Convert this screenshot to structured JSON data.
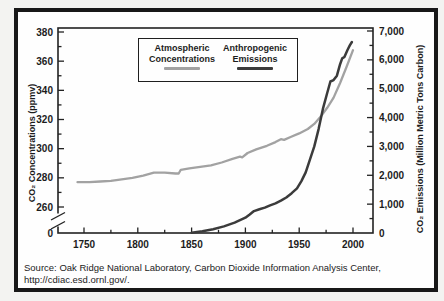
{
  "colors": {
    "concentrations_line": "#a2a2a2",
    "emissions_line": "#3b3b3b",
    "axis": "#222222",
    "frame_border": "#181818"
  },
  "legend": {
    "series1_line1": "Atmospheric",
    "series1_line2": "Concentrations",
    "series2_line1": "Anthropogenic",
    "series2_line2": "Emissions"
  },
  "source": {
    "line1": "Source: Oak Ridge National Laboratory, Carbon Dioxide Information Analysis Center,",
    "line2": "http://cdiac.esd.ornl.gov/."
  },
  "chart_data": {
    "type": "line",
    "title": "",
    "x_axis": {
      "label": "",
      "range": [
        1726,
        2018
      ],
      "ticks": [
        {
          "value": 1750,
          "label": "1750"
        },
        {
          "value": 1800,
          "label": "1800"
        },
        {
          "value": 1850,
          "label": "1850"
        },
        {
          "value": 1900,
          "label": "1900"
        },
        {
          "value": 1950,
          "label": "1950"
        },
        {
          "value": 2000,
          "label": "2000"
        }
      ],
      "minor_ticks": [
        1775,
        1825,
        1875,
        1925,
        1975
      ]
    },
    "left_axis": {
      "label": "CO₂ Concentrations (ppmv)",
      "unit": "ppmv",
      "range": [
        260,
        380
      ],
      "has_break_to_zero": true,
      "ticks": [
        {
          "value": 380,
          "label": "380"
        },
        {
          "value": 360,
          "label": "360"
        },
        {
          "value": 340,
          "label": "340"
        },
        {
          "value": 320,
          "label": "320"
        },
        {
          "value": 300,
          "label": "300"
        },
        {
          "value": 280,
          "label": "280"
        },
        {
          "value": 260,
          "label": "260"
        },
        {
          "value": "baseline",
          "label": "0"
        }
      ],
      "minor_ticks": [
        270,
        290,
        310,
        330,
        350,
        370
      ]
    },
    "right_axis": {
      "label": "CO₂ Emissions (Million Metric Tons Carbon)",
      "unit": "Million Metric Tons Carbon",
      "range": [
        0,
        7000
      ],
      "ticks": [
        {
          "value": 7000,
          "label": "7,000"
        },
        {
          "value": 6000,
          "label": "6,000"
        },
        {
          "value": 5000,
          "label": "5,000"
        },
        {
          "value": 4000,
          "label": "4,000"
        },
        {
          "value": 3000,
          "label": "3,000"
        },
        {
          "value": 2000,
          "label": "2,000"
        },
        {
          "value": 1000,
          "label": "1,000"
        },
        {
          "value": 0,
          "label": "0"
        }
      ],
      "minor_ticks": [
        500,
        1500,
        2500,
        3500,
        4500,
        5500,
        6500
      ]
    },
    "series": [
      {
        "name": "Atmospheric Concentrations",
        "axis": "left",
        "unit": "ppmv",
        "color": "#a2a2a2",
        "points": [
          [
            1744,
            277
          ],
          [
            1755,
            277
          ],
          [
            1765,
            277.5
          ],
          [
            1775,
            278
          ],
          [
            1785,
            279
          ],
          [
            1795,
            280
          ],
          [
            1805,
            281.5
          ],
          [
            1815,
            283.5
          ],
          [
            1825,
            283.5
          ],
          [
            1835,
            283
          ],
          [
            1838,
            283
          ],
          [
            1840,
            285.5
          ],
          [
            1848,
            286.5
          ],
          [
            1858,
            287.5
          ],
          [
            1868,
            288.5
          ],
          [
            1878,
            290.5
          ],
          [
            1888,
            293
          ],
          [
            1895,
            294.5
          ],
          [
            1897,
            294
          ],
          [
            1902,
            297
          ],
          [
            1910,
            299.5
          ],
          [
            1920,
            302
          ],
          [
            1928,
            304.5
          ],
          [
            1933,
            306.5
          ],
          [
            1936,
            306
          ],
          [
            1942,
            308
          ],
          [
            1950,
            310.5
          ],
          [
            1958,
            313.5
          ],
          [
            1964,
            317
          ],
          [
            1970,
            322
          ],
          [
            1976,
            328
          ],
          [
            1982,
            335
          ],
          [
            1988,
            345
          ],
          [
            1994,
            356
          ],
          [
            2000,
            367.5
          ]
        ]
      },
      {
        "name": "Anthropogenic Emissions",
        "axis": "right",
        "unit": "Million Metric Tons Carbon",
        "color": "#3b3b3b",
        "points": [
          [
            1850,
            10
          ],
          [
            1860,
            60
          ],
          [
            1870,
            130
          ],
          [
            1880,
            230
          ],
          [
            1890,
            360
          ],
          [
            1900,
            530
          ],
          [
            1904,
            640
          ],
          [
            1908,
            760
          ],
          [
            1913,
            820
          ],
          [
            1918,
            880
          ],
          [
            1923,
            960
          ],
          [
            1928,
            1030
          ],
          [
            1933,
            1120
          ],
          [
            1938,
            1230
          ],
          [
            1943,
            1380
          ],
          [
            1948,
            1550
          ],
          [
            1952,
            1800
          ],
          [
            1956,
            2100
          ],
          [
            1960,
            2550
          ],
          [
            1964,
            3000
          ],
          [
            1968,
            3600
          ],
          [
            1972,
            4300
          ],
          [
            1976,
            4850
          ],
          [
            1979,
            5250
          ],
          [
            1982,
            5300
          ],
          [
            1985,
            5450
          ],
          [
            1988,
            5850
          ],
          [
            1990,
            6050
          ],
          [
            1992,
            6100
          ],
          [
            1995,
            6350
          ],
          [
            1997,
            6500
          ],
          [
            1999,
            6620
          ]
        ]
      }
    ]
  }
}
